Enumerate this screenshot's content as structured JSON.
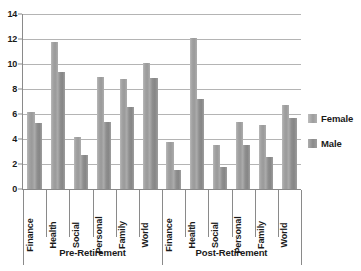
{
  "chart_data": {
    "type": "bar",
    "title": "",
    "xlabel": "",
    "ylabel": "",
    "ylim": [
      0,
      14
    ],
    "ytick_step": 2,
    "yticks": [
      "0",
      "2",
      "4",
      "6",
      "8",
      "10",
      "12",
      "14"
    ],
    "grid": true,
    "legend_position": "right",
    "groups": [
      "Pre-Retirement",
      "Post-Retirement"
    ],
    "categories": [
      "Finance",
      "Health",
      "Social",
      "Personal",
      "Family",
      "World",
      "Finance",
      "Health",
      "Social",
      "Personal",
      "Family",
      "World"
    ],
    "group_categories": {
      "Pre-Retirement": [
        "Finance",
        "Health",
        "Social",
        "Personal",
        "Family",
        "World"
      ],
      "Post-Retirement": [
        "Finance",
        "Health",
        "Social",
        "Personal",
        "Family",
        "World"
      ]
    },
    "series": [
      {
        "name": "Female",
        "color": "#a3a3a3",
        "values": [
          6.2,
          11.8,
          4.2,
          9.0,
          8.8,
          10.1,
          3.8,
          12.1,
          3.5,
          5.4,
          5.1,
          6.7
        ]
      },
      {
        "name": "Male",
        "color": "#8c8c8c",
        "values": [
          5.3,
          9.4,
          2.7,
          5.4,
          6.6,
          8.9,
          1.5,
          7.2,
          1.8,
          3.5,
          2.6,
          5.7
        ]
      }
    ]
  },
  "legend": {
    "items": [
      {
        "label": "Female",
        "key": "female"
      },
      {
        "label": "Male",
        "key": "male"
      }
    ]
  },
  "colors": {
    "bar_female": "#a3a3a3",
    "bar_male": "#8c8c8c",
    "gridline": "#b4b4b4",
    "axis": "#8a8a8a",
    "text": "#1a1a1a",
    "background": "#ffffff"
  }
}
